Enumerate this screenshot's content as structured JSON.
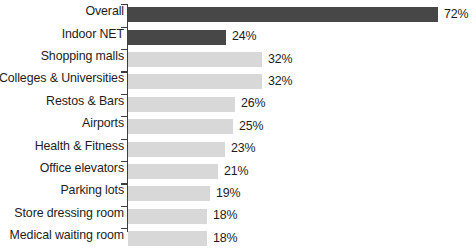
{
  "chart_data": {
    "type": "bar",
    "orientation": "horizontal",
    "title": "",
    "subtitle": "",
    "xlabel": "",
    "ylabel": "",
    "grid": false,
    "legend": null,
    "axis_line": true,
    "value_suffix": "%",
    "categories": [
      "Overall",
      "Indoor NET",
      "Shopping malls",
      "Colleges & Universities",
      "Restos & Bars",
      "Airports",
      "Health & Fitness",
      "Office elevators",
      "Parking lots",
      "Store dressing room",
      "Medical waiting room"
    ],
    "values": [
      72,
      24,
      32,
      32,
      26,
      25,
      23,
      21,
      19,
      18,
      18
    ],
    "value_labels": [
      "72%",
      "24%",
      "32%",
      "32%",
      "26%",
      "25%",
      "23%",
      "21%",
      "19%",
      "18%",
      "18%"
    ],
    "bar_pixel_widths": [
      310,
      98,
      134,
      134,
      107,
      105,
      97,
      90,
      82,
      79,
      79
    ],
    "bar_styles": [
      "dark",
      "dark",
      "light",
      "light",
      "light",
      "light",
      "light",
      "light",
      "light",
      "light",
      "light"
    ],
    "colors": {
      "dark_bar": "#474747",
      "light_bar": "#d8d8d8",
      "axis": "#3d3d3d",
      "text": "#1d1d1d",
      "background": "#ffffff"
    }
  }
}
